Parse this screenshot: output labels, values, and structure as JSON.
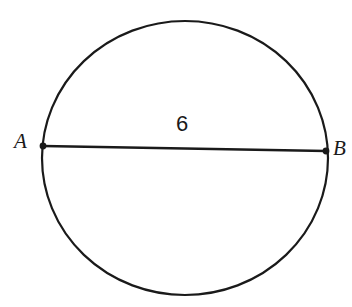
{
  "figure": {
    "name": "circle-with-diameter",
    "background_color": "#ffffff",
    "stroke_color": "#1a1a1a",
    "canvas": {
      "width": 352,
      "height": 307
    }
  },
  "circle": {
    "name": "circle-outline",
    "center_x": 185,
    "center_y": 158,
    "radius_x": 143,
    "radius_y": 137,
    "stroke_width": 2.2
  },
  "diameter": {
    "name": "segment-AB",
    "x1": 43,
    "y1": 146,
    "x2": 326,
    "y2": 151,
    "stroke_width": 2.4,
    "length_label": "6"
  },
  "points": [
    {
      "id": "A",
      "label": "A",
      "x": 43,
      "y": 146,
      "dot_radius": 3.4
    },
    {
      "id": "B",
      "label": "B",
      "x": 326,
      "y": 151,
      "dot_radius": 3.4
    }
  ],
  "labels": {
    "point_a": "A",
    "point_b": "B",
    "diameter_measure": "6"
  }
}
